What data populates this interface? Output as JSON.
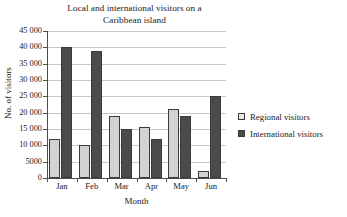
{
  "chart_data": {
    "type": "bar",
    "title": "Local and international visitors on a Caribbean island",
    "title_lines": [
      "Local and international visitors on a",
      "Caribbean island"
    ],
    "xlabel": "Month",
    "ylabel": "No. of visitors",
    "categories": [
      "Jan",
      "Feb",
      "Mar",
      "Apr",
      "May",
      "Jun"
    ],
    "series": [
      {
        "name": "Regional visitors",
        "color": "#d2d2d2",
        "values": [
          12000,
          10000,
          19000,
          15700,
          21000,
          2000
        ]
      },
      {
        "name": "International visitors",
        "color": "#4b4b4b",
        "values": [
          40000,
          39000,
          15000,
          11800,
          19000,
          25000
        ]
      }
    ],
    "ylim": [
      0,
      45000
    ],
    "ytick_values": [
      0,
      5000,
      10000,
      15000,
      20000,
      25000,
      30000,
      35000,
      40000,
      45000
    ],
    "ytick_labels": [
      "0",
      "5000",
      "10 000",
      "15 000",
      "20 000",
      "25 000",
      "30 000",
      "35 000",
      "40 000",
      "45 000"
    ],
    "grid": "horizontal",
    "legend_position": "right",
    "legend": [
      {
        "label": "Regional visitors",
        "swatch": "light"
      },
      {
        "label": "International visitors",
        "swatch": "dark"
      }
    ]
  }
}
